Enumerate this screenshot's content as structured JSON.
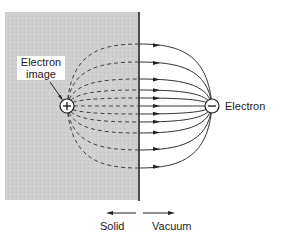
{
  "labels": {
    "electron_image_line1": "Electron",
    "electron_image_line2": "image",
    "electron": "Electron",
    "solid": "Solid",
    "vacuum": "Vacuum"
  },
  "symbols": {
    "image_charge": "+",
    "electron_charge": "−"
  },
  "colors": {
    "solid_fill": "#cfcfcf",
    "line": "#333333",
    "background": "#ffffff"
  },
  "field_line_offsets_px": [
    -62,
    -44,
    -27,
    -16,
    -8,
    0,
    8,
    16,
    27,
    44,
    62
  ]
}
